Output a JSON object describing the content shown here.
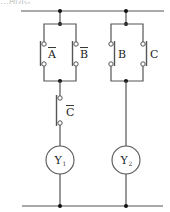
{
  "header": {
    "partial_text": "…所示。"
  },
  "diagram": {
    "type": "relay-ladder-circuit",
    "rails": {
      "top_label": "",
      "bottom_label": ""
    },
    "branches": [
      {
        "name": "branch-1",
        "parallel_contacts": [
          {
            "label": "A",
            "negated": true,
            "type": "normally-open"
          },
          {
            "label": "B",
            "negated": true,
            "type": "normally-open"
          }
        ],
        "series_contacts": [
          {
            "label": "C",
            "negated": true,
            "type": "normally-open"
          }
        ],
        "coil": {
          "label": "Y",
          "subscript": "1"
        }
      },
      {
        "name": "branch-2",
        "parallel_contacts": [
          {
            "label": "B",
            "negated": false,
            "type": "normally-open"
          },
          {
            "label": "C",
            "negated": false,
            "type": "normally-open"
          }
        ],
        "series_contacts": [],
        "coil": {
          "label": "Y",
          "subscript": "2"
        }
      }
    ]
  },
  "labels": {
    "a": "A",
    "b_bar": "B",
    "b": "B",
    "c": "C",
    "c_bar": "C",
    "y1": "Y",
    "y1_sub": "1",
    "y2": "Y",
    "y2_sub": "2"
  }
}
